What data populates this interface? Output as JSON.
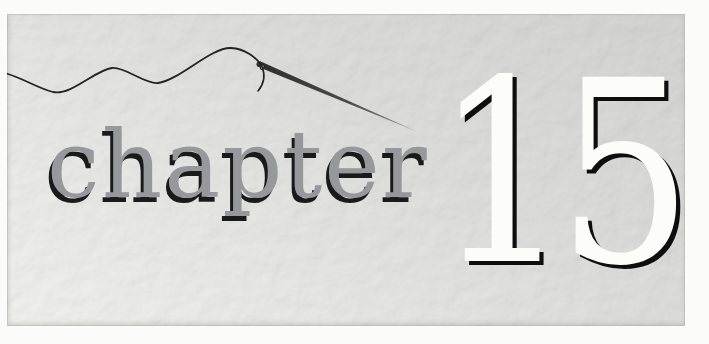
{
  "page": {
    "background_color": "#fbfbfa"
  },
  "opener": {
    "word": "chapter",
    "number": "15",
    "word_color": "#97989b",
    "word_shadow_color": "#1a1a1a",
    "number_color": "#fcfcf9",
    "number_shadow_color": "#0e0e0e",
    "panel_gradient_start": "#c2c3bf",
    "panel_gradient_end": "#e9e9e5",
    "texture_description": "embossed floral paper"
  },
  "illustration": {
    "name": "needle and thread",
    "thread_color": "#232323",
    "needle_dark_color": "#2e2e2e",
    "needle_light_color": "#888884",
    "needle_eye_fill": "#d8d8d4"
  }
}
